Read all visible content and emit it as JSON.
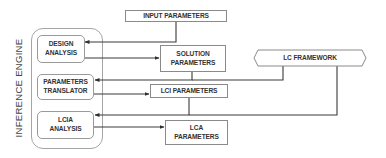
{
  "diagram": {
    "container": {
      "label": "INFERENCE ENGINE"
    },
    "nodes": {
      "input_parameters": "INPUT PARAMETERS",
      "design_analysis": "DESIGN\nANALYSIS",
      "solution_parameters": "SOLUTION\nPARAMETERS",
      "lc_framework": "LC FRAMEWORK",
      "parameters_translator": "PARAMETERS\nTRANSLATOR",
      "lci_parameters": "LCI PARAMETERS",
      "lcia_analysis": "LCIA\nANALYSIS",
      "lca_parameters": "LCA\nPARAMETERS"
    },
    "edges": [
      {
        "from": "INPUT PARAMETERS",
        "to": "DESIGN ANALYSIS"
      },
      {
        "from": "DESIGN ANALYSIS",
        "to": "SOLUTION PARAMETERS"
      },
      {
        "from": "SOLUTION PARAMETERS",
        "to": "PARAMETERS TRANSLATOR"
      },
      {
        "from": "LC FRAMEWORK",
        "to": "PARAMETERS TRANSLATOR"
      },
      {
        "from": "PARAMETERS TRANSLATOR",
        "to": "LCI PARAMETERS"
      },
      {
        "from": "LCI PARAMETERS",
        "to": "LCIA ANALYSIS"
      },
      {
        "from": "LC FRAMEWORK",
        "to": "LCIA ANALYSIS"
      },
      {
        "from": "LCIA ANALYSIS",
        "to": "LCA PARAMETERS"
      }
    ],
    "colors": {
      "line": "#3a3a3a",
      "box_border": "#8a8a8a",
      "text": "#333333"
    }
  }
}
